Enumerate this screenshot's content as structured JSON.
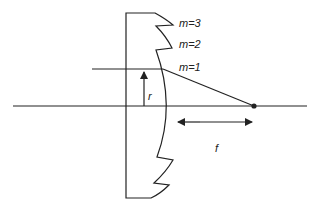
{
  "diagram": {
    "zone_labels": [
      "m=3",
      "m=2",
      "m=1"
    ],
    "radius_label": "r",
    "focal_label": "f",
    "colors": {
      "line": "#222222",
      "background": "#ffffff"
    }
  }
}
